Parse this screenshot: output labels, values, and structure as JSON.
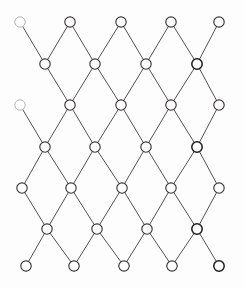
{
  "figure": {
    "title": "",
    "caption": "",
    "background_color": "#fdfdfd",
    "node_fill": "#fdfdfd",
    "node_stroke": "#3a3638",
    "edge_color": "#555052",
    "width": 244,
    "height": 289
  },
  "chart_data": {
    "type": "diagram",
    "diagram_kind": "diamond-lattice-graph",
    "title": "",
    "xlabel": "",
    "ylabel": "",
    "grid": false,
    "legend": null,
    "annotations": [],
    "row_count": 7,
    "column_pattern": [
      5,
      4,
      5,
      4,
      5,
      4,
      5
    ],
    "node_radius": 5.2,
    "nodes": [
      {
        "id": "r0c0",
        "row": 0,
        "col": 0,
        "x": 20,
        "y": 22,
        "style": "faded"
      },
      {
        "id": "r0c1",
        "row": 0,
        "col": 1,
        "x": 70,
        "y": 22,
        "style": "normal"
      },
      {
        "id": "r0c2",
        "row": 0,
        "col": 2,
        "x": 121,
        "y": 22,
        "style": "normal"
      },
      {
        "id": "r0c3",
        "row": 0,
        "col": 3,
        "x": 171,
        "y": 22,
        "style": "normal"
      },
      {
        "id": "r0c4",
        "row": 0,
        "col": 4,
        "x": 219,
        "y": 22,
        "style": "normal"
      },
      {
        "id": "r1c0",
        "row": 1,
        "col": 0,
        "x": 45,
        "y": 64,
        "style": "normal"
      },
      {
        "id": "r1c1",
        "row": 1,
        "col": 1,
        "x": 95,
        "y": 64,
        "style": "normal"
      },
      {
        "id": "r1c2",
        "row": 1,
        "col": 2,
        "x": 146,
        "y": 64,
        "style": "normal"
      },
      {
        "id": "r1c3",
        "row": 1,
        "col": 3,
        "x": 197,
        "y": 64,
        "style": "bold"
      },
      {
        "id": "r2c0",
        "row": 2,
        "col": 0,
        "x": 20,
        "y": 105,
        "style": "faded"
      },
      {
        "id": "r2c1",
        "row": 2,
        "col": 1,
        "x": 70,
        "y": 105,
        "style": "normal"
      },
      {
        "id": "r2c2",
        "row": 2,
        "col": 2,
        "x": 121,
        "y": 105,
        "style": "normal"
      },
      {
        "id": "r2c3",
        "row": 2,
        "col": 3,
        "x": 171,
        "y": 105,
        "style": "normal"
      },
      {
        "id": "r2c4",
        "row": 2,
        "col": 4,
        "x": 219,
        "y": 105,
        "style": "normal"
      },
      {
        "id": "r3c0",
        "row": 3,
        "col": 0,
        "x": 45,
        "y": 147,
        "style": "normal"
      },
      {
        "id": "r3c1",
        "row": 3,
        "col": 1,
        "x": 95,
        "y": 147,
        "style": "normal"
      },
      {
        "id": "r3c2",
        "row": 3,
        "col": 2,
        "x": 146,
        "y": 147,
        "style": "normal"
      },
      {
        "id": "r3c3",
        "row": 3,
        "col": 3,
        "x": 197,
        "y": 147,
        "style": "bold"
      },
      {
        "id": "r4c0",
        "row": 4,
        "col": 0,
        "x": 22,
        "y": 188,
        "style": "normal"
      },
      {
        "id": "r4c1",
        "row": 4,
        "col": 1,
        "x": 71,
        "y": 188,
        "style": "normal"
      },
      {
        "id": "r4c2",
        "row": 4,
        "col": 2,
        "x": 122,
        "y": 188,
        "style": "normal"
      },
      {
        "id": "r4c3",
        "row": 4,
        "col": 3,
        "x": 171,
        "y": 188,
        "style": "normal"
      },
      {
        "id": "r4c4",
        "row": 4,
        "col": 4,
        "x": 219,
        "y": 188,
        "style": "normal"
      },
      {
        "id": "r5c0",
        "row": 5,
        "col": 0,
        "x": 47,
        "y": 229,
        "style": "normal"
      },
      {
        "id": "r5c1",
        "row": 5,
        "col": 1,
        "x": 97,
        "y": 229,
        "style": "normal"
      },
      {
        "id": "r5c2",
        "row": 5,
        "col": 2,
        "x": 147,
        "y": 229,
        "style": "normal"
      },
      {
        "id": "r5c3",
        "row": 5,
        "col": 3,
        "x": 197,
        "y": 229,
        "style": "bold"
      },
      {
        "id": "r6c0",
        "row": 6,
        "col": 0,
        "x": 26,
        "y": 266,
        "style": "normal"
      },
      {
        "id": "r6c1",
        "row": 6,
        "col": 1,
        "x": 74,
        "y": 266,
        "style": "normal"
      },
      {
        "id": "r6c2",
        "row": 6,
        "col": 2,
        "x": 124,
        "y": 266,
        "style": "normal"
      },
      {
        "id": "r6c3",
        "row": 6,
        "col": 3,
        "x": 172,
        "y": 266,
        "style": "normal"
      },
      {
        "id": "r6c4",
        "row": 6,
        "col": 4,
        "x": 219,
        "y": 266,
        "style": "bold"
      }
    ],
    "edges": [
      [
        "r0c0",
        "r1c0"
      ],
      [
        "r0c1",
        "r1c0"
      ],
      [
        "r0c1",
        "r1c1"
      ],
      [
        "r0c2",
        "r1c1"
      ],
      [
        "r0c2",
        "r1c2"
      ],
      [
        "r0c3",
        "r1c2"
      ],
      [
        "r0c3",
        "r1c3"
      ],
      [
        "r0c4",
        "r1c3"
      ],
      [
        "r1c0",
        "r2c1"
      ],
      [
        "r1c1",
        "r2c1"
      ],
      [
        "r1c1",
        "r2c2"
      ],
      [
        "r1c2",
        "r2c2"
      ],
      [
        "r1c2",
        "r2c3"
      ],
      [
        "r1c3",
        "r2c3"
      ],
      [
        "r1c3",
        "r2c4"
      ],
      [
        "r2c0",
        "r3c0"
      ],
      [
        "r2c1",
        "r3c0"
      ],
      [
        "r2c1",
        "r3c1"
      ],
      [
        "r2c2",
        "r3c1"
      ],
      [
        "r2c2",
        "r3c2"
      ],
      [
        "r2c3",
        "r3c2"
      ],
      [
        "r2c3",
        "r3c3"
      ],
      [
        "r2c4",
        "r3c3"
      ],
      [
        "r3c0",
        "r4c0"
      ],
      [
        "r3c0",
        "r4c1"
      ],
      [
        "r3c1",
        "r4c1"
      ],
      [
        "r3c1",
        "r4c2"
      ],
      [
        "r3c2",
        "r4c2"
      ],
      [
        "r3c2",
        "r4c3"
      ],
      [
        "r3c3",
        "r4c3"
      ],
      [
        "r3c3",
        "r4c4"
      ],
      [
        "r4c0",
        "r5c0"
      ],
      [
        "r4c1",
        "r5c0"
      ],
      [
        "r4c1",
        "r5c1"
      ],
      [
        "r4c2",
        "r5c1"
      ],
      [
        "r4c2",
        "r5c2"
      ],
      [
        "r4c3",
        "r5c2"
      ],
      [
        "r4c3",
        "r5c3"
      ],
      [
        "r4c4",
        "r5c3"
      ],
      [
        "r5c0",
        "r6c0"
      ],
      [
        "r5c0",
        "r6c1"
      ],
      [
        "r5c1",
        "r6c1"
      ],
      [
        "r5c1",
        "r6c2"
      ],
      [
        "r5c2",
        "r6c2"
      ],
      [
        "r5c2",
        "r6c3"
      ],
      [
        "r5c3",
        "r6c3"
      ],
      [
        "r5c3",
        "r6c4"
      ]
    ]
  }
}
